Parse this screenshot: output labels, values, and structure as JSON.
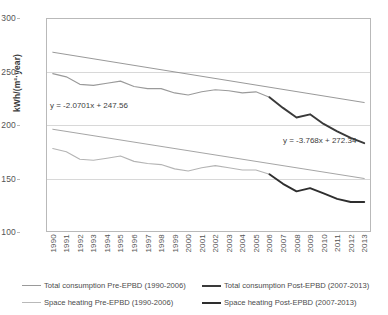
{
  "chart_data": {
    "type": "line",
    "title": "",
    "xlabel": "",
    "ylabel": "kWh/(m²·year)",
    "ylim": [
      100,
      300
    ],
    "yticks": [
      300,
      250,
      200,
      150,
      100
    ],
    "gridlines": [
      250,
      200,
      150
    ],
    "grid": true,
    "legend_position": "bottom",
    "x": [
      1990,
      1991,
      1992,
      1993,
      1994,
      1995,
      1996,
      1997,
      1998,
      1999,
      2000,
      2001,
      2002,
      2003,
      2004,
      2005,
      2006,
      2007,
      2008,
      2009,
      2010,
      2011,
      2012,
      2013
    ],
    "categories": [
      "1990",
      "1991",
      "1992",
      "1993",
      "1994",
      "1995",
      "1996",
      "1997",
      "1998",
      "1999",
      "2000",
      "2001",
      "2002",
      "2003",
      "2004",
      "2005",
      "2006",
      "2007",
      "2008",
      "2009",
      "2010",
      "2011",
      "2012",
      "2013"
    ],
    "series": [
      {
        "name": "Total consumption Pre-EPBD (1990-2006)",
        "type": "line",
        "color": "#9a9a9a",
        "x": [
          1990,
          1991,
          1992,
          1993,
          1994,
          1995,
          1996,
          1997,
          1998,
          1999,
          2000,
          2001,
          2002,
          2003,
          2004,
          2005,
          2006
        ],
        "values": [
          248,
          245,
          238,
          237,
          239,
          241,
          236,
          234,
          234,
          230,
          228,
          231,
          233,
          232,
          230,
          231,
          226
        ]
      },
      {
        "name": "Total consumption Pre-EPBD trendline",
        "type": "trendline",
        "color": "#8d8d8d",
        "equation": "y = -2.0701x + 247.56",
        "slope": -2.0701,
        "intercept": 247.56,
        "x": [
          1990,
          2013
        ],
        "values": [
          268,
          221
        ]
      },
      {
        "name": "Total consumption Post-EPBD (2007-2013)",
        "type": "line",
        "color": "#3a3a3a",
        "x": [
          2006,
          2007,
          2008,
          2009,
          2010,
          2011,
          2012,
          2013
        ],
        "values": [
          226,
          216,
          207,
          210,
          201,
          194,
          188,
          183
        ]
      },
      {
        "name": "Space heating Pre-EPBD (1990-2006)",
        "type": "line",
        "color": "#b4b4b4",
        "x": [
          1990,
          1991,
          1992,
          1993,
          1994,
          1995,
          1996,
          1997,
          1998,
          1999,
          2000,
          2001,
          2002,
          2003,
          2004,
          2005,
          2006
        ],
        "values": [
          178,
          175,
          168,
          167,
          169,
          171,
          166,
          164,
          163,
          159,
          157,
          160,
          162,
          160,
          158,
          158,
          154
        ]
      },
      {
        "name": "Space heating Pre-EPBD trendline",
        "type": "trendline",
        "color": "#9b9b9b",
        "equation": "y = -3.768x + 272.34",
        "slope": -3.768,
        "intercept": 272.34,
        "x": [
          1990,
          2013
        ],
        "values": [
          196,
          150
        ]
      },
      {
        "name": "Space heating Post-EPBD (2007-2013)",
        "type": "line",
        "color": "#2e2e2e",
        "x": [
          2006,
          2007,
          2008,
          2009,
          2010,
          2011,
          2012,
          2013
        ],
        "values": [
          154,
          145,
          138,
          141,
          136,
          131,
          128,
          128
        ]
      }
    ],
    "annotations": [
      {
        "text": "y = -2.0701x + 247.56",
        "series": "Total consumption Pre-EPBD"
      },
      {
        "text": "y = -3.768x + 272.34",
        "series": "Space heating Pre-EPBD"
      }
    ]
  },
  "axes": {
    "y_title": "kWh/(m²·year)",
    "y_labels": [
      "300",
      "250",
      "200",
      "150",
      "100"
    ],
    "x_labels": [
      "1990",
      "1991",
      "1992",
      "1993",
      "1994",
      "1995",
      "1996",
      "1997",
      "1998",
      "1999",
      "2000",
      "2001",
      "2002",
      "2003",
      "2004",
      "2005",
      "2006",
      "2007",
      "2008",
      "2009",
      "2010",
      "2011",
      "2012",
      "2013"
    ]
  },
  "annotations": {
    "eq_total": "y = -2.0701x + 247.56",
    "eq_heating": "y = -3.768x + 272.34"
  },
  "legend": {
    "items": [
      {
        "label": "Total consumption Pre-EPBD (1990-2006)",
        "color": "#9a9a9a",
        "weight": "1.2px"
      },
      {
        "label": "Total consumption Post-EPBD (2007-2013)",
        "color": "#3a3a3a",
        "weight": "2px"
      },
      {
        "label": "Space heating Pre-EPBD (1990-2006)",
        "color": "#b9b9b9",
        "weight": "1.2px"
      },
      {
        "label": "Space heating Post-EPBD (2007-2013)",
        "color": "#2e2e2e",
        "weight": "2px"
      }
    ]
  },
  "colors": {
    "pre_epbd": "#9a9a9a",
    "post_epbd": "#333333",
    "grid": "#d8d8d8",
    "frame": "#b9b9b9",
    "text": "#4b4b4b"
  }
}
